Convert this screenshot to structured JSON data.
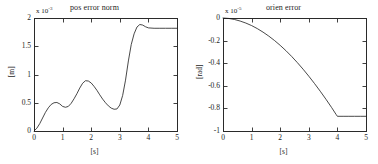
{
  "figure": {
    "background": "#ffffff",
    "panel_count": 2
  },
  "chart_data": [
    {
      "type": "line",
      "panel": "left",
      "title": "pos error norm",
      "xlabel": "[s]",
      "ylabel": "[m]",
      "y_exponent_prefix": "x 10",
      "y_exponent": "-3",
      "xlim": [
        0,
        5
      ],
      "ylim": [
        0,
        2
      ],
      "xticks": [
        0,
        1,
        2,
        3,
        4,
        5
      ],
      "xticklabels": [
        "0",
        "1",
        "2",
        "3",
        "4",
        "5"
      ],
      "yticks": [
        0,
        0.5,
        1,
        1.5,
        2
      ],
      "yticklabels": [
        "0",
        "0.5",
        "1",
        "1.5",
        "2"
      ],
      "grid": false,
      "legend": null,
      "line_color": "#1a1a1a",
      "line_width": 0.8,
      "x": [
        0.0,
        0.1,
        0.2,
        0.3,
        0.4,
        0.5,
        0.6,
        0.7,
        0.8,
        0.9,
        1.0,
        1.1,
        1.2,
        1.3,
        1.4,
        1.5,
        1.6,
        1.7,
        1.8,
        1.9,
        2.0,
        2.1,
        2.2,
        2.3,
        2.4,
        2.5,
        2.6,
        2.7,
        2.8,
        2.9,
        3.0,
        3.1,
        3.2,
        3.3,
        3.4,
        3.5,
        3.6,
        3.7,
        3.8,
        3.9,
        4.0,
        4.2,
        4.4,
        4.6,
        4.8,
        5.0
      ],
      "values": [
        0.0,
        0.05,
        0.13,
        0.23,
        0.33,
        0.41,
        0.47,
        0.5,
        0.505,
        0.48,
        0.435,
        0.42,
        0.435,
        0.49,
        0.57,
        0.66,
        0.76,
        0.845,
        0.89,
        0.885,
        0.85,
        0.79,
        0.72,
        0.64,
        0.565,
        0.5,
        0.445,
        0.405,
        0.385,
        0.39,
        0.46,
        0.63,
        0.9,
        1.24,
        1.53,
        1.72,
        1.84,
        1.885,
        1.875,
        1.845,
        1.825,
        1.818,
        1.818,
        1.818,
        1.818,
        1.818
      ],
      "annotations": [
        {
          "label": "first local max",
          "x": 0.8,
          "y": 0.505
        },
        {
          "label": "local min",
          "x": 1.1,
          "y": 0.42
        },
        {
          "label": "second local max",
          "x": 1.8,
          "y": 0.89
        },
        {
          "label": "global min before rise",
          "x": 2.8,
          "y": 0.385
        },
        {
          "label": "overshoot peak",
          "x": 3.7,
          "y": 1.885
        },
        {
          "label": "steady state",
          "x": 5.0,
          "y": 1.818
        }
      ]
    },
    {
      "type": "line",
      "panel": "right",
      "title": "orien error",
      "xlabel": "[s]",
      "ylabel": "[rad]",
      "y_exponent_prefix": "x 10",
      "y_exponent": "-5",
      "xlim": [
        0,
        5
      ],
      "ylim": [
        -1,
        0
      ],
      "xticks": [
        0,
        1,
        2,
        3,
        4,
        5
      ],
      "xticklabels": [
        "0",
        "1",
        "2",
        "3",
        "4",
        "5"
      ],
      "yticks": [
        -1,
        -0.8,
        -0.6,
        -0.4,
        -0.2,
        0
      ],
      "yticklabels": [
        "-1",
        "-0.8",
        "-0.6",
        "-0.4",
        "-0.2",
        "0"
      ],
      "grid": false,
      "legend": null,
      "line_color": "#1a1a1a",
      "line_width": 0.8,
      "x": [
        0.0,
        0.2,
        0.4,
        0.6,
        0.8,
        1.0,
        1.2,
        1.4,
        1.6,
        1.8,
        2.0,
        2.2,
        2.4,
        2.6,
        2.8,
        3.0,
        3.2,
        3.4,
        3.6,
        3.8,
        3.95,
        4.0,
        4.2,
        4.4,
        4.6,
        4.8,
        5.0
      ],
      "values": [
        0.0,
        -0.004,
        -0.013,
        -0.027,
        -0.045,
        -0.067,
        -0.094,
        -0.125,
        -0.16,
        -0.199,
        -0.242,
        -0.289,
        -0.34,
        -0.395,
        -0.453,
        -0.515,
        -0.58,
        -0.648,
        -0.719,
        -0.793,
        -0.852,
        -0.87,
        -0.87,
        -0.87,
        -0.87,
        -0.87,
        -0.87
      ],
      "annotations": [
        {
          "label": "start",
          "x": 0.0,
          "y": 0.0
        },
        {
          "label": "knee / settle",
          "x": 4.0,
          "y": -0.87
        },
        {
          "label": "steady state",
          "x": 5.0,
          "y": -0.87
        }
      ]
    }
  ]
}
